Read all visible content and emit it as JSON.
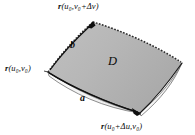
{
  "figure": {
    "name": "parametric-surface-patch-with-tangent-vectors",
    "background_color": "#ffffff",
    "surface": {
      "fill_color": "#b6b6b6",
      "edge_color": "#1a1a1a",
      "thickness_band_color": "#f2f2f2",
      "shadow_color": "#8c8c8c",
      "dashed_edges": [
        "upper-left",
        "upper-right"
      ],
      "solid_edges": [
        "lower-left",
        "lower-right"
      ]
    },
    "vertices": {
      "left": {
        "x": 48,
        "y": 72
      },
      "top": {
        "x": 93,
        "y": 22
      },
      "right": {
        "x": 182,
        "y": 63
      },
      "bottom": {
        "x": 140,
        "y": 113
      }
    },
    "labels": {
      "region": "D",
      "vector_a": "a",
      "vector_b": "b",
      "point_origin": {
        "vector": "r",
        "args": "(u₀,v₀)",
        "full": "r(u₀,v₀)"
      },
      "point_v_increment": {
        "vector": "r",
        "args": "(u₀,v₀+Δv)",
        "full": "r(u₀,v₀+Δv)"
      },
      "point_u_increment": {
        "vector": "r",
        "args": "(u₀+Δu,v₀)",
        "full": "r(u₀+Δu,v₀)"
      }
    },
    "parts": {
      "r_symbol": "r",
      "open_paren": "(",
      "close_paren": ")",
      "comma": ",",
      "plus": "+",
      "u_var": "u",
      "v_var": "v",
      "zero_sub": "0",
      "delta_u": "Δu",
      "delta_v": "Δv"
    }
  }
}
